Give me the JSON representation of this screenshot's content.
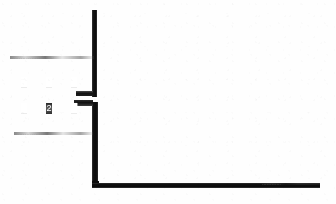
{
  "drawing": {
    "type": "scanned-floor-plan",
    "background_color": "#fefefe",
    "ink_color": "#1a1a1a",
    "faint_ink_color": "#8d8d8d"
  },
  "annotations": {
    "dimension_line_top": "……………………",
    "dimension_line_bottom": "…………………",
    "edge_note_right": "…………"
  },
  "glyphs": {
    "row_one": [
      "█",
      "█",
      "█"
    ],
    "row_two": [
      "█",
      "2",
      "█"
    ]
  },
  "walls": {
    "vertical_upper_label": "vertical-wall-upper",
    "vertical_lower_label": "vertical-wall-lower",
    "horizontal_bottom_label": "horizontal-wall-bottom",
    "door_opening_label": "door-opening"
  }
}
